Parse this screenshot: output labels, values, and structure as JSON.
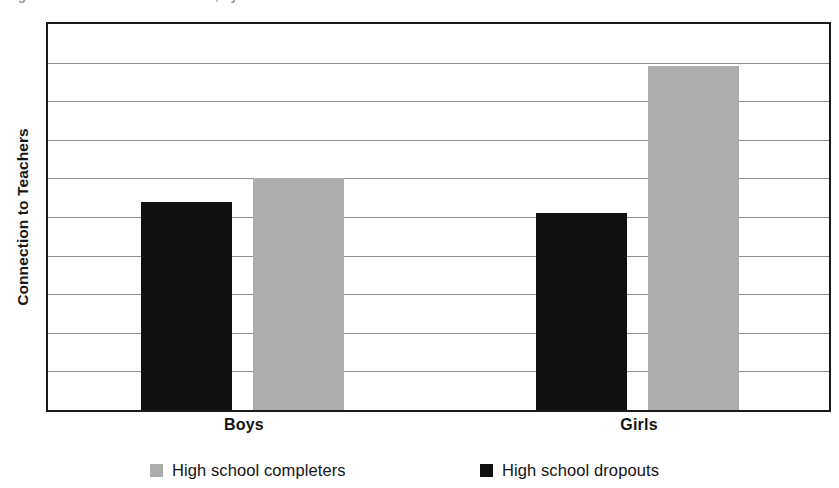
{
  "figure": {
    "width": 839,
    "height": 488,
    "background": "#ffffff",
    "top_clipped_caption": "Figure 4. Connection to teachers, by sex"
  },
  "axis": {
    "y_title": "Connection to Teachers"
  },
  "legend": {
    "position": "bottom-center",
    "items": [
      {
        "label": "High school completers",
        "color": "#adadad",
        "swatch": "gray-square"
      },
      {
        "label": "High school dropouts",
        "color": "#111111",
        "swatch": "black-square"
      }
    ]
  },
  "colors": {
    "completers": "#adadad",
    "dropouts": "#111111",
    "plot_border": "#1a1a1a",
    "gridline": "#8d8d8d",
    "text": "#141414",
    "background": "#ffffff"
  },
  "chart_data": {
    "type": "bar",
    "title": "Connection to Teachers",
    "subtitle": "",
    "xlabel": "",
    "ylabel": "Connection to Teachers",
    "categories": [
      "Boys",
      "Girls"
    ],
    "series": [
      {
        "name": "High school completers",
        "color": "#adadad",
        "values": [
          6.0,
          8.9
        ]
      },
      {
        "name": "High school dropouts",
        "color": "#111111",
        "values": [
          5.4,
          5.1
        ]
      }
    ],
    "series_draw_order": [
      "High school dropouts",
      "High school completers"
    ],
    "ylim": [
      0,
      10
    ],
    "yticks": [
      0,
      1,
      2,
      3,
      4,
      5,
      6,
      7,
      8,
      9,
      10
    ],
    "ytick_labels": [],
    "grid": true,
    "grid_axis": "y",
    "gridline_count": 9,
    "legend_position": "bottom",
    "annotations": []
  },
  "layout": {
    "plot": {
      "left": 46,
      "top": 22,
      "width": 785,
      "height": 390
    },
    "bars": [
      {
        "group": "Boys",
        "series": "High school dropouts",
        "left": 93,
        "width": 91,
        "value": 5.4
      },
      {
        "group": "Boys",
        "series": "High school completers",
        "left": 205,
        "width": 91,
        "value": 6.0
      },
      {
        "group": "Girls",
        "series": "High school dropouts",
        "left": 488,
        "width": 91,
        "value": 5.1
      },
      {
        "group": "Girls",
        "series": "High school completers",
        "left": 600,
        "width": 91,
        "value": 8.9
      }
    ],
    "category_label_positions": [
      {
        "label": "Boys",
        "left": 103,
        "width": 190
      },
      {
        "label": "Girls",
        "left": 498,
        "width": 190
      }
    ],
    "legend_positions": [
      {
        "left": 104
      },
      {
        "left": 434
      }
    ]
  }
}
